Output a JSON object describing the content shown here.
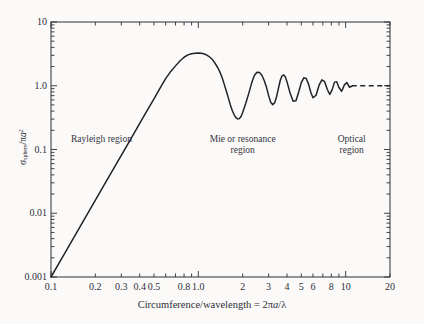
{
  "chart_data": {
    "type": "line",
    "title": "",
    "xlabel": "Circumference/wavelength = 2πa/λ",
    "ylabel": "σsphere/πa²",
    "xscale": "log",
    "yscale": "log",
    "xlim": [
      0.1,
      20
    ],
    "ylim": [
      0.001,
      10
    ],
    "grid": false,
    "legend": "none",
    "xticks": [
      "0.1",
      "0.2",
      "0.3",
      "0.4",
      "0.5",
      "0.8",
      "1.0",
      "2",
      "3",
      "4",
      "5",
      "6",
      "8",
      "10",
      "20"
    ],
    "xtick_values": [
      0.1,
      0.2,
      0.3,
      0.4,
      0.5,
      0.8,
      1.0,
      2,
      3,
      4,
      5,
      6,
      8,
      10,
      20
    ],
    "yticks": [
      "10",
      "1.0",
      "0.1",
      "0.01",
      "0.001"
    ],
    "ytick_values": [
      10,
      1.0,
      0.1,
      0.01,
      0.001
    ],
    "asymptote_value": 1.0,
    "asymptote_style": "dashed",
    "series": [
      {
        "name": "Mie scattering efficiency",
        "style": "solid",
        "x": [
          0.1,
          0.12,
          0.15,
          0.18,
          0.22,
          0.26,
          0.3,
          0.35,
          0.4,
          0.45,
          0.5,
          0.55,
          0.6,
          0.65,
          0.7,
          0.75,
          0.8,
          0.85,
          0.9,
          0.95,
          1.0,
          1.05,
          1.1,
          1.15,
          1.2,
          1.25,
          1.3,
          1.35,
          1.4,
          1.45,
          1.5,
          1.55,
          1.6,
          1.65,
          1.7,
          1.75,
          1.8,
          1.85,
          1.9,
          1.95,
          2.0,
          2.1,
          2.2,
          2.3,
          2.4,
          2.5,
          2.6,
          2.7,
          2.8,
          2.9,
          3.0,
          3.1,
          3.2,
          3.3,
          3.4,
          3.5,
          3.6,
          3.7,
          3.8,
          3.9,
          4.0,
          4.2,
          4.4,
          4.6,
          4.8,
          5.0,
          5.2,
          5.4,
          5.6,
          5.8,
          6.0,
          6.3,
          6.6,
          6.9,
          7.2,
          7.5,
          7.8,
          8.1,
          8.4,
          8.7,
          9.0,
          9.4,
          9.8,
          10.2,
          10.6,
          11.0
        ],
        "y": [
          0.001,
          0.00207,
          0.00506,
          0.01048,
          0.02343,
          0.04582,
          0.081,
          0.15,
          0.256,
          0.41,
          0.625,
          0.915,
          1.296,
          1.68,
          2.05,
          2.45,
          2.8,
          3.05,
          3.18,
          3.24,
          3.26,
          3.24,
          3.15,
          3.0,
          2.8,
          2.55,
          2.25,
          1.95,
          1.65,
          1.35,
          1.05,
          0.82,
          0.64,
          0.5,
          0.41,
          0.35,
          0.315,
          0.302,
          0.305,
          0.33,
          0.38,
          0.53,
          0.76,
          1.1,
          1.45,
          1.63,
          1.62,
          1.46,
          1.21,
          0.95,
          0.7,
          0.55,
          0.505,
          0.54,
          0.68,
          0.92,
          1.22,
          1.43,
          1.48,
          1.37,
          1.15,
          0.76,
          0.57,
          0.58,
          0.8,
          1.12,
          1.33,
          1.3,
          1.06,
          0.79,
          0.65,
          0.71,
          1.02,
          1.24,
          1.16,
          0.88,
          0.73,
          0.87,
          1.14,
          1.16,
          0.94,
          0.82,
          1.03,
          1.12,
          0.95,
          0.98
        ],
        "peaks": [
          {
            "x": 1.0,
            "y": 3.26,
            "label": "principal maximum"
          },
          {
            "x": 2.45,
            "y": 1.64
          },
          {
            "x": 3.8,
            "y": 1.48
          },
          {
            "x": 5.2,
            "y": 1.33
          },
          {
            "x": 6.6,
            "y": 1.24
          },
          {
            "x": 8.4,
            "y": 1.16
          }
        ],
        "minima": [
          {
            "x": 1.85,
            "y": 0.3
          },
          {
            "x": 3.2,
            "y": 0.5
          },
          {
            "x": 4.4,
            "y": 0.57
          },
          {
            "x": 5.9,
            "y": 0.64
          },
          {
            "x": 7.5,
            "y": 0.73
          },
          {
            "x": 9.4,
            "y": 0.82
          }
        ]
      }
    ],
    "annotations": [
      {
        "name": "rayleigh-region",
        "text": "Rayleigh region",
        "x": 0.22,
        "y": 0.13,
        "lines": [
          "Rayleigh region"
        ]
      },
      {
        "name": "mie-region",
        "text": "Mie or resonance region",
        "x": 2.0,
        "y": 0.13,
        "lines": [
          "Mie or resonance",
          "region"
        ]
      },
      {
        "name": "optical-region",
        "text": "Optical region",
        "x": 11.0,
        "y": 0.13,
        "lines": [
          "Optical",
          "region"
        ]
      }
    ]
  },
  "axes": {
    "x_title_parts": {
      "prefix": "Circumference/wavelength = 2",
      "pi": "π",
      "a": "a",
      "slash": "/",
      "lambda": "λ"
    },
    "y_title_parts": {
      "sigma": "σ",
      "sub": "sphere",
      "mid": "/",
      "pi": "π",
      "a": "a",
      "sup": "2"
    }
  },
  "style": {
    "background": "#fbfaf8",
    "axis_color": "#2e2e38",
    "curve_color": "#22222b",
    "text_color": "#2e2e38"
  }
}
